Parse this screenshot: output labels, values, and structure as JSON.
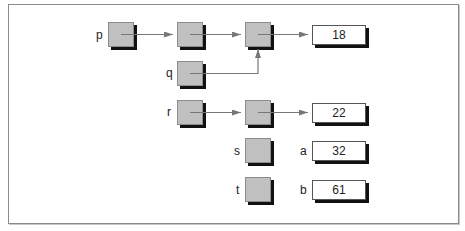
{
  "diagram": {
    "type": "pointer-diagram",
    "pointer_labels": [
      "p",
      "q",
      "r",
      "s",
      "t"
    ],
    "variable_labels": [
      "a",
      "b"
    ],
    "values": {
      "row1": "18",
      "row3": "22",
      "a": "32",
      "b": "61"
    },
    "colors": {
      "pointer_fill": "#c0c0c0",
      "shadow": "#111111",
      "arrow": "#777777",
      "frame": "#8a8a8a"
    },
    "edges": [
      {
        "from": "p",
        "to": "node1"
      },
      {
        "from": "node1",
        "to": "node2"
      },
      {
        "from": "q",
        "to": "node2"
      },
      {
        "from": "node2",
        "to": "18"
      },
      {
        "from": "r",
        "to": "node3"
      },
      {
        "from": "node3",
        "to": "22"
      }
    ]
  }
}
